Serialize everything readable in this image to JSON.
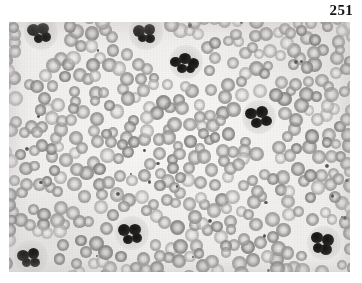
{
  "page": {
    "number": "251",
    "background_color": "#ffffff"
  },
  "figure": {
    "name": "blood-smear-micrograph",
    "kind": "photomicrograph",
    "frame": {
      "x": 9,
      "y": 22,
      "width": 341,
      "height": 250
    },
    "colors": {
      "background": "#f1efee",
      "erythrocyte": "#9a9897",
      "leukocyte_nucleus": "#1d1c1b",
      "platelet": "#5a5856"
    },
    "caption": "",
    "label": ""
  },
  "cells": {
    "leukocytes": [
      {
        "id": "wbc-top-left",
        "cx": 41,
        "cy": 33,
        "lobes": [
          [
            -8,
            -3,
            13,
            12
          ],
          [
            2,
            -5,
            12,
            11
          ],
          [
            5,
            4,
            10,
            10
          ],
          [
            -3,
            5,
            9,
            9
          ]
        ]
      },
      {
        "id": "wbc-top-center",
        "cx": 146,
        "cy": 33,
        "lobes": [
          [
            -7,
            -2,
            12,
            12
          ],
          [
            3,
            -4,
            11,
            11
          ],
          [
            4,
            5,
            10,
            9
          ],
          [
            -4,
            5,
            9,
            8
          ]
        ]
      },
      {
        "id": "wbc-neutrophil",
        "cx": 186,
        "cy": 62,
        "lobes": [
          [
            -11,
            0,
            11,
            10
          ],
          [
            -1,
            -4,
            12,
            11
          ],
          [
            7,
            1,
            11,
            11
          ],
          [
            -4,
            6,
            10,
            9
          ],
          [
            4,
            7,
            9,
            8
          ]
        ]
      },
      {
        "id": "wbc-mid-right",
        "cx": 259,
        "cy": 117,
        "lobes": [
          [
            -8,
            -4,
            12,
            11
          ],
          [
            3,
            -5,
            12,
            12
          ],
          [
            7,
            4,
            11,
            10
          ],
          [
            -3,
            6,
            11,
            10
          ]
        ]
      },
      {
        "id": "wbc-bottom-center",
        "cx": 132,
        "cy": 233,
        "lobes": [
          [
            -8,
            -3,
            12,
            12
          ],
          [
            3,
            -4,
            12,
            11
          ],
          [
            5,
            5,
            10,
            10
          ],
          [
            -4,
            6,
            10,
            9
          ]
        ]
      },
      {
        "id": "wbc-bottom-right",
        "cx": 324,
        "cy": 243,
        "lobes": [
          [
            -7,
            -6,
            12,
            11
          ],
          [
            4,
            -3,
            12,
            12
          ],
          [
            2,
            6,
            12,
            11
          ],
          [
            -6,
            5,
            10,
            10
          ]
        ]
      },
      {
        "id": "wbc-bottom-left",
        "cx": 31,
        "cy": 257,
        "lobes": [
          [
            -8,
            -2,
            12,
            11
          ],
          [
            2,
            -4,
            11,
            11
          ],
          [
            4,
            5,
            10,
            9
          ],
          [
            -5,
            5,
            9,
            9
          ]
        ]
      }
    ],
    "erythrocyte_count_approx": 430,
    "platelet_count_approx": 26
  }
}
